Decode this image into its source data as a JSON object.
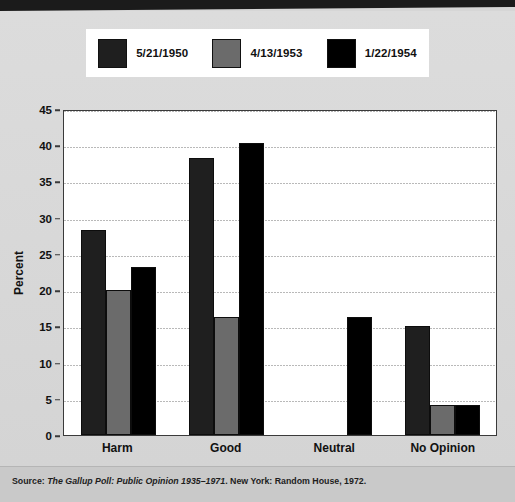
{
  "banner": {
    "color": "#1b1b1b"
  },
  "legend": {
    "items": [
      {
        "label": "5/21/1950",
        "color": "#1f1f1f"
      },
      {
        "label": "4/13/1953",
        "color": "#6b6b6b"
      },
      {
        "label": "1/22/1954",
        "color": "#000000"
      }
    ]
  },
  "axis": {
    "y_title": "Percent",
    "y_ticks": [
      "0",
      "5",
      "10",
      "15",
      "20",
      "25",
      "30",
      "35",
      "40",
      "45"
    ]
  },
  "footer": {
    "source_prefix": "Source: ",
    "source_title": "The Gallup Poll: Public Opinion 1935–1971",
    "source_suffix": ". New York: Random House, 1972."
  },
  "chart_data": {
    "type": "bar",
    "title": "",
    "xlabel": "",
    "ylabel": "Percent",
    "ylim": [
      0,
      45
    ],
    "ytick_step": 5,
    "grid": true,
    "legend_position": "top",
    "categories": [
      "Harm",
      "Good",
      "Neutral",
      "No Opinion"
    ],
    "series": [
      {
        "name": "5/21/1950",
        "color": "#1f1f1f",
        "values": [
          28.3,
          38.2,
          0,
          15.1
        ]
      },
      {
        "name": "4/13/1953",
        "color": "#6b6b6b",
        "values": [
          20.0,
          16.3,
          0,
          4.2
        ]
      },
      {
        "name": "1/22/1954",
        "color": "#000000",
        "values": [
          23.2,
          40.3,
          16.3,
          4.2
        ]
      }
    ]
  }
}
